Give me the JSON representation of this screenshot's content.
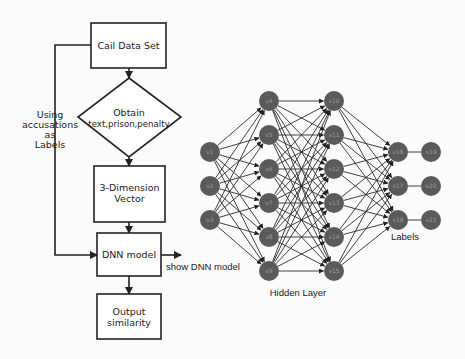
{
  "flowchart": {
    "cail_box": {
      "label": "Cail Data Set"
    },
    "decision": {
      "line1": "Obtain",
      "line2": "text,prison,penalty"
    },
    "vector_box": {
      "line1": "3-Dimension",
      "line2": "Vector"
    },
    "dnn_box": {
      "label": "DNN model"
    },
    "output_box": {
      "line1": "Output",
      "line2": "similarity"
    },
    "side_label": {
      "lines": [
        "Using",
        "accusations",
        "as",
        "Labels"
      ]
    },
    "show_dnn": {
      "label": "show DNN model"
    }
  },
  "network": {
    "node_color": "#5a5a5a",
    "edge_color": "#2a2a2a",
    "input_layer": [
      "v1",
      "v2",
      "v3"
    ],
    "hidden_layer_1": [
      "v4",
      "v5",
      "v6",
      "v7",
      "v8",
      "v9"
    ],
    "hidden_layer_2": [
      "v10",
      "v11",
      "v12",
      "v13",
      "v14",
      "v15"
    ],
    "output_layer_1": [
      "v16",
      "v17",
      "v18"
    ],
    "output_layer_2": [
      "v19",
      "v20",
      "v21"
    ],
    "hidden_label": "Hidden Layer",
    "labels_label": "Labels"
  }
}
